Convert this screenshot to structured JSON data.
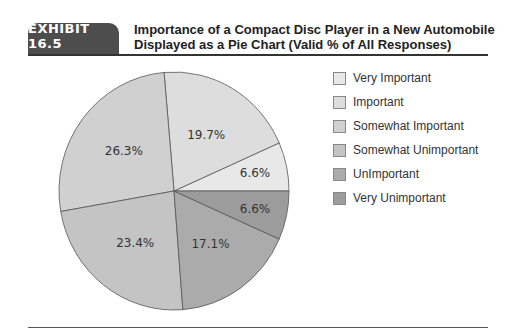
{
  "header": {
    "badge": "EXHIBIT 16.5",
    "title_line1": "Importance of a Compact Disc Player in a New Automobile",
    "title_line2": "Displayed as a Pie Chart (Valid % of All Responses)"
  },
  "chart_data": {
    "type": "pie",
    "title": "Importance of a Compact Disc Player in a New Automobile Displayed as a Pie Chart (Valid % of All Responses)",
    "categories": [
      "Very Important",
      "Important",
      "Somewhat Important",
      "Somewhat Unimportant",
      "UnImportant",
      "Very Unimportant"
    ],
    "values": [
      6.6,
      19.7,
      26.3,
      23.4,
      17.1,
      6.6
    ],
    "labels": [
      "6.6%",
      "19.7%",
      "26.3%",
      "23.4%",
      "17.1%",
      "6.6%"
    ],
    "colors": [
      "#e8e8e8",
      "#dddddd",
      "#d0d0d0",
      "#c4c4c4",
      "#ababab",
      "#9c9c9c"
    ],
    "start_angle": "3 o'clock, counter-clockwise",
    "legend_position": "right"
  },
  "legend": {
    "items": [
      {
        "label": "Very Important",
        "color": "#e8e8e8"
      },
      {
        "label": "Important",
        "color": "#dddddd"
      },
      {
        "label": "Somewhat Important",
        "color": "#d0d0d0"
      },
      {
        "label": "Somewhat Unimportant",
        "color": "#c4c4c4"
      },
      {
        "label": "UnImportant",
        "color": "#ababab"
      },
      {
        "label": "Very Unimportant",
        "color": "#9c9c9c"
      }
    ]
  }
}
